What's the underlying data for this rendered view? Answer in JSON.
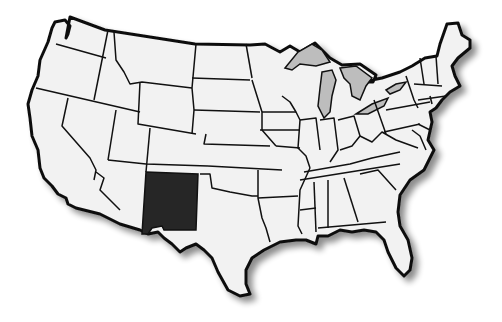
{
  "map": {
    "title": "United States map with New Mexico highlighted",
    "highlighted_state": "New Mexico",
    "colors": {
      "background": "#ffffff",
      "state_fill": "#f2f2f2",
      "highlight_fill": "#262626",
      "lakes_fill": "#bdbdbd",
      "border": "#111111",
      "shadow": "#9a9a9a"
    }
  }
}
